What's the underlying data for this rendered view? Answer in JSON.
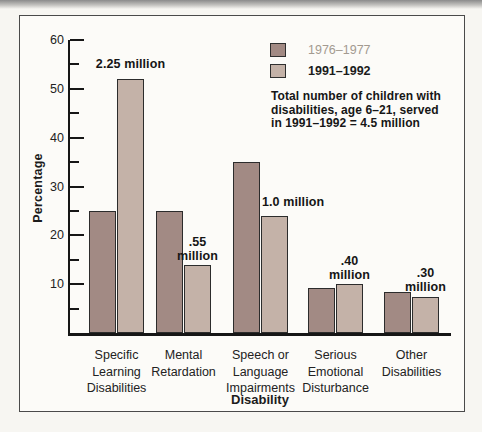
{
  "page": {
    "background": "#f7f6f2"
  },
  "legend": {
    "items": [
      {
        "label": "1976–1977",
        "swatch_color": "#a28a84",
        "label_color": "#a39a90",
        "bold": false
      },
      {
        "label": "1991–1992",
        "swatch_color": "#c4b2a8",
        "label_color": "#1b1b1b",
        "bold": true
      }
    ]
  },
  "note": {
    "lines": [
      "Total number of children with",
      "disabilities, age 6–21, served",
      "in 1991–1992 = 4.5 million"
    ]
  },
  "chart_data": {
    "type": "bar",
    "title": "",
    "xlabel": "Disability",
    "ylabel": "Percentage",
    "ylim": [
      0,
      60
    ],
    "ytick_major": 10,
    "ytick_minor": 5,
    "grid": false,
    "legend_position": "top-right",
    "categories": [
      "Specific Learning Disabilities",
      "Mental Retardation",
      "Speech or Language Impairments",
      "Serious Emotional Disturbance",
      "Other Disabilities"
    ],
    "category_lines": [
      [
        "Specific",
        "Learning",
        "Disabilities"
      ],
      [
        "Mental",
        "Retardation"
      ],
      [
        "Speech or",
        "Language",
        "Impairments"
      ],
      [
        "Serious",
        "Emotional",
        "Disturbance"
      ],
      [
        "Other",
        "Disabilities"
      ]
    ],
    "series": [
      {
        "name": "1976–1977",
        "color": "#a28a84",
        "values": [
          25,
          25,
          35,
          9.3,
          8.4
        ]
      },
      {
        "name": "1991–1992",
        "color": "#c4b2a8",
        "values": [
          52,
          14,
          24,
          10,
          7.3
        ]
      }
    ],
    "bar_labels": [
      {
        "group": 0,
        "series": 1,
        "lines": [
          "2.25 million"
        ],
        "align": "center",
        "gap": 8
      },
      {
        "group": 1,
        "series": 1,
        "lines": [
          ".55",
          "million"
        ],
        "align": "center",
        "gap": 2
      },
      {
        "group": 2,
        "series": 1,
        "lines": [
          "1.0 million"
        ],
        "align": "left",
        "gap": 7
      },
      {
        "group": 3,
        "series": 1,
        "lines": [
          ".40",
          "million"
        ],
        "align": "center",
        "gap": 2
      },
      {
        "group": 4,
        "series": 1,
        "lines": [
          ".30",
          "million"
        ],
        "align": "center",
        "gap": 3
      }
    ]
  }
}
